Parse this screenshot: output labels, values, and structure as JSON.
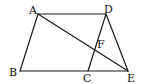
{
  "figure": {
    "type": "geometry",
    "stroke_color": "#1a1a1a",
    "background": "#ffffff",
    "points": {
      "A": {
        "label": "A",
        "x": 38,
        "y": 14
      },
      "D": {
        "label": "D",
        "x": 106,
        "y": 14
      },
      "B": {
        "label": "B",
        "x": 20,
        "y": 71
      },
      "C": {
        "label": "C",
        "x": 88,
        "y": 71
      },
      "E": {
        "label": "E",
        "x": 128,
        "y": 71
      },
      "F": {
        "label": "F",
        "x": 95,
        "y": 50
      }
    },
    "segments": [
      [
        "A",
        "D"
      ],
      [
        "A",
        "B"
      ],
      [
        "B",
        "E"
      ],
      [
        "D",
        "E"
      ],
      [
        "D",
        "C"
      ],
      [
        "A",
        "E"
      ]
    ]
  }
}
